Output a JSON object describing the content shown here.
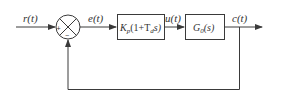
{
  "diagram": {
    "type": "closed-loop control block diagram",
    "signals": {
      "input": "r(t)",
      "error": "e(t)",
      "control": "u(t)",
      "output": "c(t)"
    },
    "summing_junction": {
      "plus_sign": "+",
      "minus_sign": "−"
    },
    "blocks": {
      "controller": {
        "gain": "K",
        "gain_sub": "p",
        "body": "(1+T",
        "body_sub": "d",
        "body_tail": "s)"
      },
      "plant": {
        "name": "G",
        "name_sub": "0",
        "arg": "(s)"
      }
    },
    "colors": {
      "line": "#3a3a3a",
      "background": "#ffffff"
    }
  }
}
